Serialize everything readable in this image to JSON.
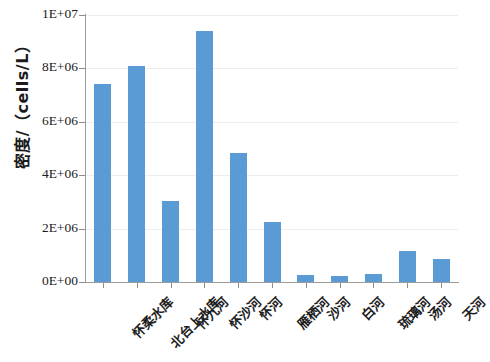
{
  "chart_data": {
    "type": "bar",
    "title": "",
    "xlabel": "",
    "ylabel": "密度/（cells/L）",
    "ylim": [
      0,
      10000000
    ],
    "ytick_labels": [
      "1E+07",
      "8E+06",
      "6E+06",
      "4E+06",
      "2E+06",
      "0E+00"
    ],
    "ytick_values": [
      10000000,
      8000000,
      6000000,
      4000000,
      2000000,
      0
    ],
    "grid": true,
    "legend": "none",
    "bar_color": "#5B9BD5",
    "categories": [
      "怀柔水库",
      "北台上水库",
      "怀九河",
      "怀沙河",
      "怀河",
      "雁栖河",
      "沙河",
      "白河",
      "琉璃河",
      "汤河",
      "天河"
    ],
    "values": [
      7400000,
      8100000,
      3050000,
      9400000,
      4850000,
      2250000,
      270000,
      230000,
      290000,
      1150000,
      860000
    ]
  },
  "axis": {
    "y_title": "密度/（cells/L）"
  }
}
